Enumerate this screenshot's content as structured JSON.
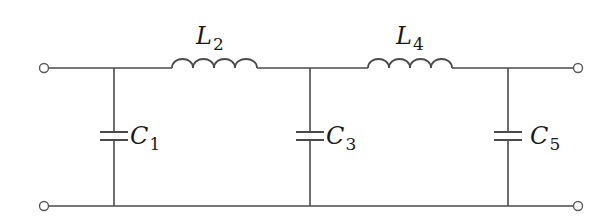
{
  "diagram": {
    "type": "ladder-lc-filter",
    "colors": {
      "wire": "#4a4a4a",
      "text": "#1a1a1a",
      "background": "#ffffff"
    },
    "terminals": [
      {
        "id": "in-top",
        "x": 44,
        "y": 68
      },
      {
        "id": "in-bottom",
        "x": 44,
        "y": 206
      },
      {
        "id": "out-top",
        "x": 578,
        "y": 68
      },
      {
        "id": "out-bottom",
        "x": 578,
        "y": 206
      }
    ],
    "components": [
      {
        "id": "C1",
        "kind": "capacitor",
        "symbol": "C",
        "subscript": "1",
        "x": 114
      },
      {
        "id": "L2",
        "kind": "inductor",
        "symbol": "L",
        "subscript": "2",
        "x_start": 172,
        "x_end": 257
      },
      {
        "id": "C3",
        "kind": "capacitor",
        "symbol": "C",
        "subscript": "3",
        "x": 310
      },
      {
        "id": "L4",
        "kind": "inductor",
        "symbol": "L",
        "subscript": "4",
        "x_start": 368,
        "x_end": 452
      },
      {
        "id": "C5",
        "kind": "capacitor",
        "symbol": "C",
        "subscript": "5",
        "x": 508
      }
    ]
  },
  "labels": {
    "L2": {
      "main": "L",
      "sub": "2"
    },
    "L4": {
      "main": "L",
      "sub": "4"
    },
    "C1": {
      "main": "C",
      "sub": "1"
    },
    "C3": {
      "main": "C",
      "sub": "3"
    },
    "C5": {
      "main": "C",
      "sub": "5"
    }
  }
}
